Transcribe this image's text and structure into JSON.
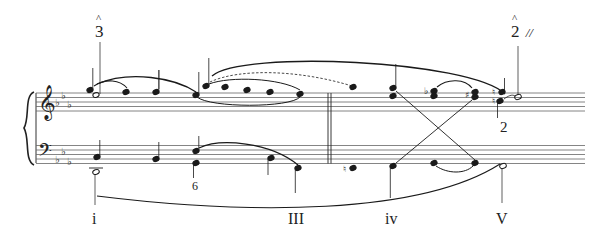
{
  "score": {
    "key_signature": "E-flat major / C minor (3 flats)",
    "clefs": [
      "treble",
      "bass"
    ],
    "ink_color": "#1a1a1a",
    "staff_line_color": "#555555"
  },
  "annotations": {
    "degree_3": {
      "text": "3",
      "caret": "^"
    },
    "degree_2": {
      "text": "2",
      "caret": "^",
      "interruption": "//"
    },
    "figured_bass_6": "6",
    "figured_bass_2": "2"
  },
  "roman_numerals": [
    {
      "label": "i"
    },
    {
      "label": "III"
    },
    {
      "label": "iv"
    },
    {
      "label": "V"
    }
  ],
  "accidentals": {
    "flat": "♭",
    "sharp": "♯",
    "natural": "♮"
  }
}
